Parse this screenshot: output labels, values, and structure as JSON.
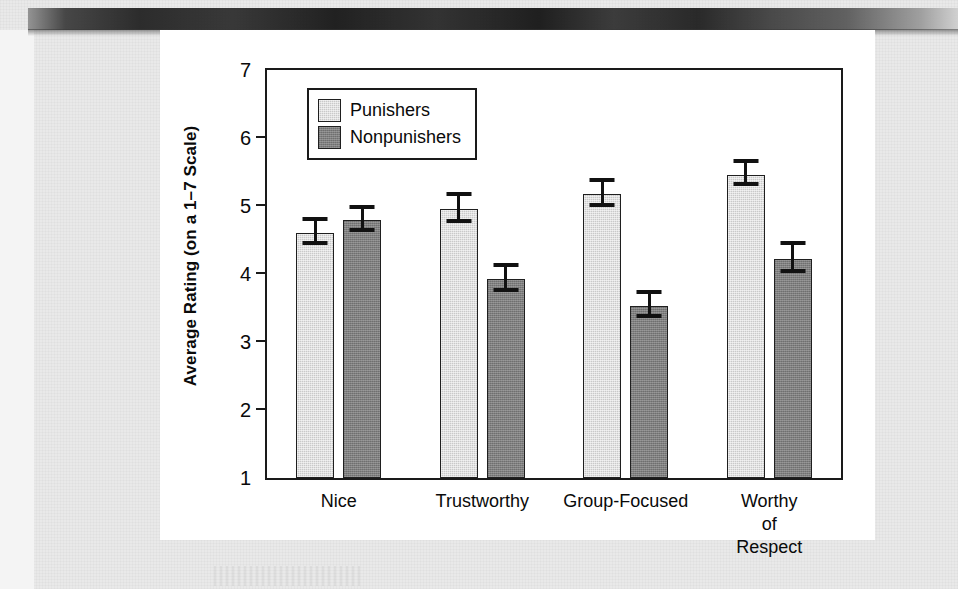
{
  "figure": {
    "background_color": "#e9e9e9",
    "card_color": "#ffffff"
  },
  "chart_data": {
    "type": "bar",
    "title": "",
    "xlabel": "",
    "ylabel": "Average Rating (on a 1–7 Scale)",
    "categories": [
      "Nice",
      "Trustworthy",
      "Group-Focused",
      "Worthy of\nRespect"
    ],
    "ylim": [
      1,
      7
    ],
    "yticks": [
      1,
      2,
      3,
      4,
      5,
      6,
      7
    ],
    "ytick_labels": [
      "1",
      "2",
      "3",
      "4",
      "5",
      "6",
      "7"
    ],
    "grid": false,
    "legend_position": "upper-left-inside",
    "error_bar_type": "standard-error",
    "series": [
      {
        "name": "Punishers",
        "color": "#c9c9c9",
        "values": [
          4.6,
          4.95,
          5.17,
          5.46
        ],
        "errors": [
          0.18,
          0.2,
          0.19,
          0.17
        ]
      },
      {
        "name": "Nonpunishers",
        "color": "#7e7e7e",
        "values": [
          4.79,
          3.92,
          3.53,
          4.22
        ],
        "errors": [
          0.17,
          0.18,
          0.17,
          0.21
        ]
      }
    ]
  },
  "legend": {
    "entries": [
      {
        "label": "Punishers",
        "swatch_class": "punishers"
      },
      {
        "label": "Nonpunishers",
        "swatch_class": "nonpunishers"
      }
    ]
  }
}
